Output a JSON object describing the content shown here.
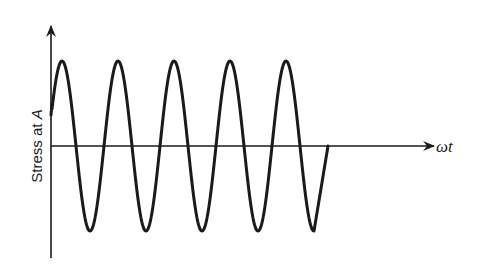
{
  "chart_data": {
    "type": "line",
    "title": "",
    "xlabel": "ωt",
    "ylabel": "Stress at A",
    "ylabel_parts": {
      "text": "Stress at ",
      "italic": "A"
    },
    "grid": false,
    "legend": null,
    "axes": {
      "origin_px": [
        51,
        146
      ],
      "y_axis_top_px": 25,
      "y_axis_bottom_px": 258,
      "x_axis_end_px": 435
    },
    "series": [
      {
        "name": "stress",
        "shape": "sinusoid",
        "cycles": 5,
        "amplitude_px": 85,
        "period_px": 56,
        "peaks_x_px": [
          62,
          118,
          174,
          230,
          286
        ],
        "troughs_x_px": [
          90,
          146,
          202,
          258,
          314
        ],
        "start_px": [
          51,
          115
        ],
        "end_px": [
          328,
          146
        ]
      }
    ],
    "colors": {
      "ink": "#1a1a1a",
      "background": "#ffffff"
    }
  }
}
